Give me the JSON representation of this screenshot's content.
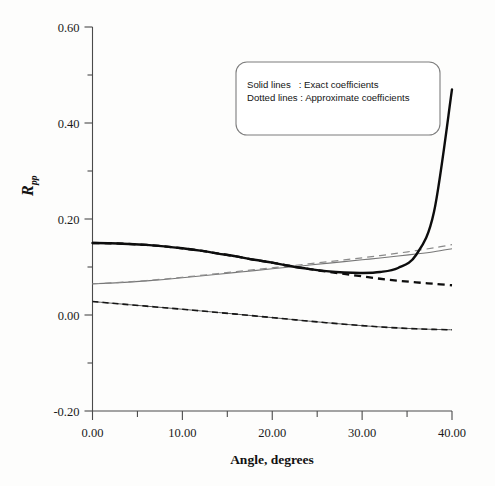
{
  "chart_data": {
    "type": "line",
    "title": "",
    "xlabel": "Angle, degrees",
    "ylabel": "R_pp",
    "ylabel_base": "R",
    "ylabel_subscript": "pp",
    "xlim": [
      0,
      40
    ],
    "ylim": [
      -0.2,
      0.6
    ],
    "grid": false,
    "x_ticks": [
      "0.00",
      "10.00",
      "20.00",
      "30.00",
      "40.00"
    ],
    "x_tick_values": [
      0,
      10,
      20,
      30,
      40
    ],
    "x_minor_step": 5,
    "y_ticks": [
      "0.60",
      "0.40",
      "0.20",
      "0.00",
      "-0.20"
    ],
    "y_tick_values": [
      0.6,
      0.4,
      0.2,
      0.0,
      -0.2
    ],
    "y_minor_step": 0.1,
    "legend_position": "top-right",
    "legend": [
      {
        "label": "Solid lines",
        "separator": ":",
        "description": "Exact coefficients"
      },
      {
        "label": "Dotted lines",
        "separator": ":",
        "description": "Approximate coefficients"
      }
    ],
    "x": [
      0,
      2,
      4,
      6,
      8,
      10,
      12,
      14,
      16,
      18,
      20,
      22,
      24,
      26,
      28,
      30,
      32,
      34,
      36,
      38,
      40
    ],
    "series": [
      {
        "name": "Exact coefficient 1",
        "style": "solid-thick",
        "values": [
          0.15,
          0.1495,
          0.148,
          0.146,
          0.143,
          0.139,
          0.134,
          0.128,
          0.122,
          0.115,
          0.109,
          0.102,
          0.096,
          0.0915,
          0.0885,
          0.0875,
          0.0895,
          0.098,
          0.125,
          0.215,
          0.47
        ]
      },
      {
        "name": "Approximate coefficient 1",
        "style": "dashed-thick",
        "values": [
          0.15,
          0.1495,
          0.148,
          0.146,
          0.143,
          0.139,
          0.134,
          0.128,
          0.122,
          0.115,
          0.109,
          0.102,
          0.096,
          0.0905,
          0.0855,
          0.0805,
          0.0755,
          0.0715,
          0.068,
          0.065,
          0.062
        ]
      },
      {
        "name": "Exact coefficient 2",
        "style": "solid-thin",
        "values": [
          0.065,
          0.0665,
          0.0685,
          0.071,
          0.074,
          0.0775,
          0.0812,
          0.085,
          0.0888,
          0.0925,
          0.0962,
          0.1,
          0.1038,
          0.1075,
          0.1112,
          0.115,
          0.1188,
          0.1228,
          0.127,
          0.1318,
          0.138
        ]
      },
      {
        "name": "Approximate coefficient 2",
        "style": "dashed-thin",
        "values": [
          0.065,
          0.0668,
          0.069,
          0.0718,
          0.075,
          0.0786,
          0.0824,
          0.0864,
          0.0904,
          0.0944,
          0.0984,
          0.1024,
          0.1065,
          0.1106,
          0.1148,
          0.1192,
          0.1238,
          0.1288,
          0.1342,
          0.14,
          0.1465
        ]
      },
      {
        "name": "Exact coefficient 3",
        "style": "solid-med",
        "values": [
          0.028,
          0.0248,
          0.0216,
          0.0184,
          0.0152,
          0.012,
          0.0086,
          0.0052,
          0.0018,
          -0.0018,
          -0.0054,
          -0.009,
          -0.0126,
          -0.016,
          -0.0192,
          -0.0222,
          -0.0248,
          -0.027,
          -0.0288,
          -0.03,
          -0.0308
        ]
      },
      {
        "name": "Approximate coefficient 3",
        "style": "dashed-med",
        "values": [
          0.028,
          0.0248,
          0.0216,
          0.0184,
          0.0152,
          0.012,
          0.0086,
          0.0052,
          0.0018,
          -0.0018,
          -0.0054,
          -0.009,
          -0.0126,
          -0.016,
          -0.0192,
          -0.0222,
          -0.0248,
          -0.027,
          -0.0288,
          -0.03,
          -0.0308
        ]
      }
    ]
  },
  "colors": {
    "axis": "#4a4a4a",
    "solid_thick": "#0d0d0d",
    "thin_gray": "#777777",
    "background": "#fdfdfc"
  }
}
